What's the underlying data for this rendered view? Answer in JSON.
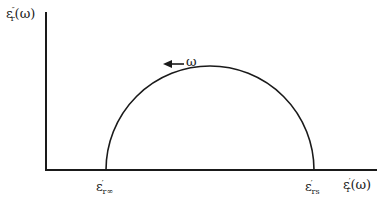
{
  "diagram": {
    "type": "cole-cole-plot",
    "y_axis_label": {
      "base": "ε",
      "sup": "″",
      "sub": "r",
      "arg": "(ω)"
    },
    "x_axis_label": {
      "base": "ε",
      "sup": "′",
      "sub": "r",
      "arg": "(ω)"
    },
    "left_intercept": {
      "base": "ε",
      "sup": "′",
      "sub": "r∞"
    },
    "right_intercept": {
      "base": "ε",
      "sup": "′",
      "sub": "rs"
    },
    "direction_label": "ω",
    "direction_arrow": "increasing frequency toward left",
    "colors": {
      "line": "#1a1a1a",
      "background": "#ffffff"
    }
  }
}
